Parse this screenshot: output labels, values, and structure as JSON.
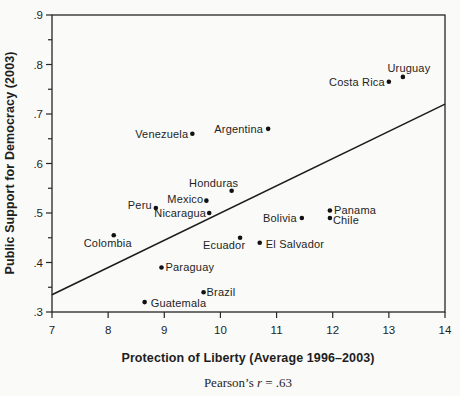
{
  "figure": {
    "background": "#fafaf8",
    "ink_color": "#1e1e1e"
  },
  "chart_data": {
    "type": "scatter",
    "title": "",
    "xlabel": "Protection of Liberty (Average 1996–2003)",
    "ylabel": "Public Support for Democracy (2003)",
    "caption": {
      "prefix": "Pearson’s ",
      "symbol": "r",
      "suffix": " = .63"
    },
    "xlim": [
      7,
      14
    ],
    "ylim": [
      0.3,
      0.9
    ],
    "grid": false,
    "legend": "none",
    "x_ticks": [
      {
        "v": 7,
        "label": "7"
      },
      {
        "v": 8,
        "label": "8"
      },
      {
        "v": 9,
        "label": "9"
      },
      {
        "v": 10,
        "label": "10"
      },
      {
        "v": 11,
        "label": "11"
      },
      {
        "v": 12,
        "label": "12"
      },
      {
        "v": 13,
        "label": "13"
      },
      {
        "v": 14,
        "label": "14"
      }
    ],
    "y_ticks": [
      {
        "v": 0.3,
        "label": ".3"
      },
      {
        "v": 0.4,
        "label": ".4"
      },
      {
        "v": 0.5,
        "label": ".5"
      },
      {
        "v": 0.6,
        "label": ".6"
      },
      {
        "v": 0.7,
        "label": ".7"
      },
      {
        "v": 0.8,
        "label": ".8"
      },
      {
        "v": 0.9,
        "label": ".9"
      }
    ],
    "y_minor_ticks": [
      0.35,
      0.45,
      0.55,
      0.65,
      0.75,
      0.85
    ],
    "trend_line": {
      "x1": 7,
      "y1": 0.335,
      "x2": 14,
      "y2": 0.72
    },
    "points": [
      {
        "name": "Venezuela",
        "x": 9.5,
        "y": 0.66,
        "anchor": "end",
        "dx": -4,
        "dy": 0
      },
      {
        "name": "Argentina",
        "x": 10.85,
        "y": 0.67,
        "anchor": "end",
        "dx": -5,
        "dy": 0
      },
      {
        "name": "Costa Rica",
        "x": 13.0,
        "y": 0.765,
        "anchor": "end",
        "dx": -4,
        "dy": 0
      },
      {
        "name": "Uruguay",
        "x": 13.25,
        "y": 0.775,
        "anchor": "middle",
        "dx": 6,
        "dy": -9
      },
      {
        "name": "Honduras",
        "x": 10.2,
        "y": 0.545,
        "anchor": "middle",
        "dx": -18,
        "dy": -8
      },
      {
        "name": "Peru",
        "x": 8.85,
        "y": 0.51,
        "anchor": "end",
        "dx": -4,
        "dy": -3
      },
      {
        "name": "Mexico",
        "x": 9.75,
        "y": 0.525,
        "anchor": "end",
        "dx": -3,
        "dy": -2
      },
      {
        "name": "Nicaragua",
        "x": 9.8,
        "y": 0.5,
        "anchor": "end",
        "dx": -3,
        "dy": 0
      },
      {
        "name": "Colombia",
        "x": 8.1,
        "y": 0.455,
        "anchor": "middle",
        "dx": -6,
        "dy": 8
      },
      {
        "name": "Ecuador",
        "x": 10.35,
        "y": 0.45,
        "anchor": "middle",
        "dx": -16,
        "dy": 7
      },
      {
        "name": "El Salvador",
        "x": 10.7,
        "y": 0.44,
        "anchor": "start",
        "dx": 6,
        "dy": 1
      },
      {
        "name": "Bolivia",
        "x": 11.45,
        "y": 0.49,
        "anchor": "end",
        "dx": -5,
        "dy": 0
      },
      {
        "name": "Panama",
        "x": 11.95,
        "y": 0.505,
        "anchor": "start",
        "dx": 4,
        "dy": -1
      },
      {
        "name": "Chile",
        "x": 11.95,
        "y": 0.49,
        "anchor": "start",
        "dx": 3,
        "dy": 2
      },
      {
        "name": "Paraguay",
        "x": 8.95,
        "y": 0.39,
        "anchor": "start",
        "dx": 4,
        "dy": 0
      },
      {
        "name": "Brazil",
        "x": 9.7,
        "y": 0.34,
        "anchor": "start",
        "dx": 3,
        "dy": 0
      },
      {
        "name": "Guatemala",
        "x": 8.65,
        "y": 0.32,
        "anchor": "start",
        "dx": 6,
        "dy": 1
      }
    ]
  }
}
